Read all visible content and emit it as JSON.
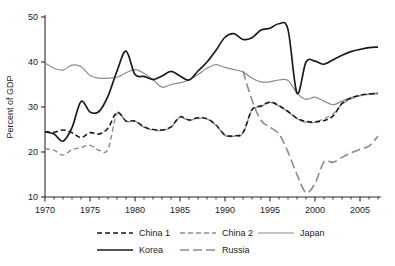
{
  "chart_data": {
    "type": "line",
    "title": "",
    "subtitle": "",
    "xlabel": "",
    "ylabel": "Percent of GDP",
    "xlim": [
      1970,
      2007
    ],
    "ylim": [
      8.5,
      51.5
    ],
    "yticks": [
      10,
      20,
      30,
      40,
      50
    ],
    "ytick_labels": [
      "10",
      "20",
      "30",
      "40",
      "50"
    ],
    "xticks": [
      1970,
      1975,
      1980,
      1985,
      1990,
      1995,
      2000,
      2005
    ],
    "xtick_labels": [
      "1970",
      "1975",
      "1980",
      "1985",
      "1990",
      "1995",
      "2000",
      "2005"
    ],
    "minor_xticks_every": 1,
    "grid": false,
    "legend_position": "bottom",
    "series": [
      {
        "name": "China 1",
        "style": "dashed",
        "color": "#1a1a1a",
        "width": 1.6,
        "dash": "5,3",
        "x": [
          1970,
          1971,
          1972,
          1973,
          1974,
          1975,
          1976,
          1977,
          1978,
          1979,
          1980,
          1981,
          1982,
          1983,
          1984,
          1985,
          1986,
          1987,
          1988,
          1989,
          1990,
          1991,
          1992,
          1993,
          1994,
          1995,
          1996,
          1997,
          1998,
          1999,
          2000,
          2001,
          2002,
          2003,
          2004,
          2005,
          2006,
          2007
        ],
        "values": [
          24.5,
          24.4,
          24.9,
          24.3,
          23.2,
          24.3,
          24.0,
          25.3,
          28.8,
          26.9,
          26.9,
          25.6,
          25.0,
          24.9,
          25.6,
          27.8,
          27.1,
          27.6,
          27.4,
          26.0,
          23.8,
          23.6,
          24.3,
          29.4,
          30.2,
          31.1,
          30.3,
          29.0,
          27.5,
          26.8,
          26.7,
          27.0,
          28.0,
          30.8,
          32.0,
          32.6,
          32.9,
          33.0
        ]
      },
      {
        "name": "China 2",
        "style": "dashed",
        "color": "#8c8c8c",
        "width": 1.4,
        "dash": "5,3",
        "x": [
          1970,
          1971,
          1972,
          1973,
          1974,
          1975,
          1976,
          1977,
          1978,
          1979,
          1980,
          1981,
          1982,
          1983,
          1984,
          1985,
          1986,
          1987,
          1988,
          1989,
          1990,
          1991,
          1992,
          1993,
          1994,
          1995,
          1996,
          1997,
          1998,
          1999,
          2000,
          2001,
          2002,
          2003,
          2004,
          2005,
          2006,
          2007
        ],
        "values": [
          20.7,
          20.4,
          19.3,
          20.5,
          21.0,
          21.5,
          20.4,
          20.6,
          28.6,
          26.8,
          26.8,
          25.5,
          24.9,
          24.8,
          25.5,
          27.7,
          27.0,
          27.5,
          27.3,
          25.9,
          23.7,
          23.5,
          24.2,
          29.3,
          30.1,
          31.0,
          30.2,
          28.9,
          27.4,
          26.6,
          26.6,
          27.4,
          28.4,
          30.6,
          31.8,
          32.5,
          32.8,
          33.0
        ]
      },
      {
        "name": "Japan",
        "style": "solid",
        "color": "#8c8c8c",
        "width": 1.2,
        "dash": "",
        "x": [
          1970,
          1971,
          1972,
          1973,
          1974,
          1975,
          1976,
          1977,
          1978,
          1979,
          1980,
          1981,
          1982,
          1983,
          1984,
          1985,
          1986,
          1987,
          1988,
          1989,
          1990,
          1991,
          1992,
          1993,
          1994,
          1995,
          1996,
          1997,
          1998,
          1999,
          2000,
          2001,
          2002,
          2003,
          2004,
          2005,
          2006,
          2007
        ],
        "values": [
          39.8,
          38.6,
          38.2,
          39.3,
          39.0,
          37.0,
          36.4,
          36.4,
          36.6,
          37.6,
          38.3,
          37.5,
          36.1,
          34.4,
          35.0,
          35.4,
          36.0,
          37.2,
          38.6,
          39.4,
          38.8,
          38.3,
          37.8,
          36.4,
          35.6,
          35.6,
          36.0,
          35.9,
          33.1,
          31.7,
          32.2,
          31.3,
          30.5,
          31.3,
          32.1,
          32.6,
          32.9,
          33.1
        ]
      },
      {
        "name": "Korea",
        "style": "solid",
        "color": "#1a1a1a",
        "width": 1.7,
        "dash": "",
        "x": [
          1970,
          1971,
          1972,
          1973,
          1974,
          1975,
          1976,
          1977,
          1978,
          1979,
          1980,
          1981,
          1982,
          1983,
          1984,
          1985,
          1986,
          1987,
          1988,
          1989,
          1990,
          1991,
          1992,
          1993,
          1994,
          1995,
          1996,
          1997,
          1998,
          1999,
          2000,
          2001,
          2002,
          2003,
          2004,
          2005,
          2006,
          2007
        ],
        "values": [
          24.5,
          24.0,
          22.4,
          25.4,
          31.2,
          28.9,
          29.0,
          32.4,
          38.0,
          42.4,
          37.2,
          36.8,
          36.1,
          36.9,
          37.9,
          36.9,
          36.0,
          38.0,
          40.0,
          42.6,
          45.5,
          46.3,
          45.0,
          45.4,
          47.1,
          47.5,
          48.5,
          47.2,
          33.1,
          40.0,
          40.2,
          39.5,
          40.5,
          41.5,
          42.3,
          42.8,
          43.2,
          43.3
        ]
      },
      {
        "name": "Russia",
        "style": "long-dashed",
        "color": "#8c8c8c",
        "width": 1.6,
        "dash": "9,4",
        "x": [
          1992,
          1993,
          1994,
          1995,
          1996,
          1997,
          1998,
          1999,
          2000,
          2001,
          2002,
          2003,
          2004,
          2005,
          2006,
          2007
        ],
        "values": [
          38.0,
          31.5,
          27.0,
          25.5,
          24.0,
          20.0,
          15.0,
          11.0,
          13.0,
          17.8,
          17.7,
          18.8,
          19.8,
          20.6,
          21.3,
          23.5
        ]
      }
    ]
  },
  "axes": {
    "ylabel": "Percent of GDP"
  },
  "legend": {
    "entries": [
      {
        "label": "China 1"
      },
      {
        "label": "China 2"
      },
      {
        "label": "Japan"
      },
      {
        "label": "Korea"
      },
      {
        "label": "Russia"
      }
    ]
  }
}
